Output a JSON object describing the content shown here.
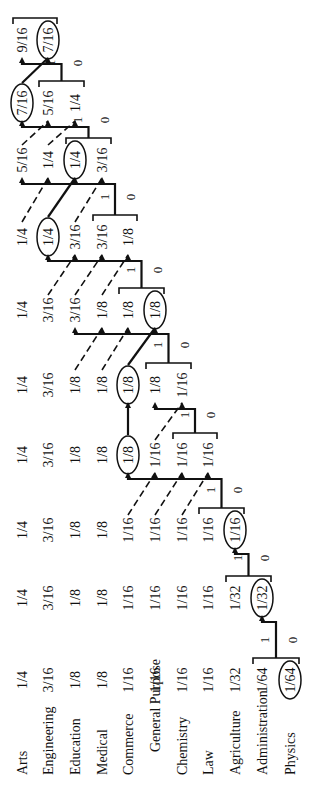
{
  "diagram": {
    "type": "huffman-coding-tree",
    "orientation": "rotated-90-ccw",
    "categories": [
      "Arts",
      "Engineering",
      "Education",
      "Medical",
      "Commerce",
      "General Purpose",
      "Chemistry",
      "Law",
      "Agriculture",
      "Administration",
      "Physics"
    ],
    "row_x": [
      22,
      48,
      75,
      102,
      128,
      155,
      182,
      208,
      235,
      262,
      290
    ],
    "columns": [
      {
        "y": 680,
        "values": [
          "1/4",
          "3/16",
          "1/8",
          "1/8",
          "1/16",
          "1/16",
          "1/16",
          "1/16",
          "1/32",
          "1/64",
          "1/64"
        ],
        "circled": 10
      },
      {
        "y": 598,
        "values": [
          "1/4",
          "3/16",
          "1/8",
          "1/8",
          "1/16",
          "1/16",
          "1/16",
          "1/16",
          "1/32",
          "1/32"
        ],
        "circled": 9
      },
      {
        "y": 530,
        "values": [
          "1/4",
          "3/16",
          "1/8",
          "1/8",
          "1/16",
          "1/16",
          "1/16",
          "1/16",
          "1/16"
        ],
        "circled": 8
      },
      {
        "y": 455,
        "values": [
          "1/4",
          "3/16",
          "1/8",
          "1/8",
          "1/8",
          "1/16",
          "1/16",
          "1/16"
        ],
        "circled": 4
      },
      {
        "y": 385,
        "values": [
          "1/4",
          "3/16",
          "1/8",
          "1/8",
          "1/8",
          "1/8",
          "1/16"
        ],
        "circled": 4
      },
      {
        "y": 310,
        "values": [
          "1/4",
          "3/16",
          "3/16",
          "1/8",
          "1/8",
          "1/8"
        ],
        "circled": 5
      },
      {
        "y": 237,
        "values": [
          "1/4",
          "1/4",
          "3/16",
          "3/16",
          "1/8"
        ],
        "circled": 1
      },
      {
        "y": 160,
        "values": [
          "5/16",
          "1/4",
          "1/4",
          "3/16"
        ],
        "circled": 2
      },
      {
        "y": 103,
        "values": [
          "7/16",
          "5/16",
          "1/4"
        ],
        "circled": 0
      },
      {
        "y": 40,
        "values": [
          "9/16",
          "7/16"
        ],
        "circled": 1
      }
    ],
    "merges": [
      {
        "bit1": "1",
        "bit0": "0"
      },
      {
        "bit1": "1",
        "bit0": "0"
      },
      {
        "bit1": "1",
        "bit0": "0"
      },
      {
        "bit1": "1",
        "bit0": "0"
      },
      {
        "bit1": "1",
        "bit0": "0"
      },
      {
        "bit1": "1",
        "bit0": "0"
      },
      {
        "bit1": "1",
        "bit0": "0"
      },
      {
        "bit1": "1",
        "bit0": "0"
      },
      {
        "bit1": "1",
        "bit0": "0"
      },
      {
        "bit1": "1",
        "bit0": "0"
      }
    ]
  }
}
